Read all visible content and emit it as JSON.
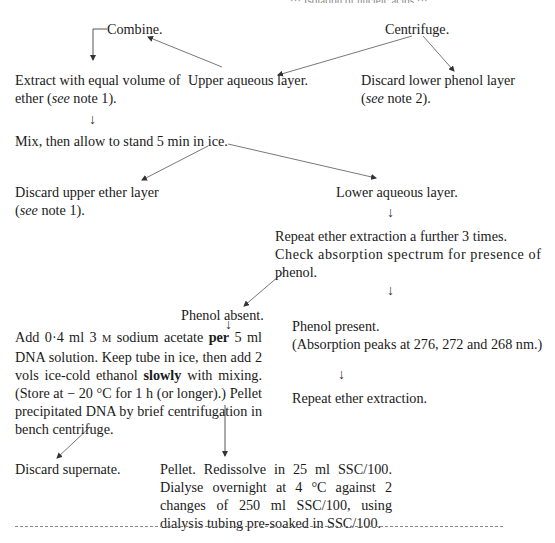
{
  "page": {
    "header_fragment": "··· Isolation of nucleic acids ···",
    "footer_fragment": ""
  },
  "flowchart": {
    "combine": "Combine.",
    "centrifuge": "Centrifuge.",
    "extract": {
      "line1": "Extract with equal volume of",
      "line2_pre": "ether (",
      "line2_see": "see",
      "line2_post": " note 1)."
    },
    "upper_aqueous": "Upper aqueous layer.",
    "discard_phenol": {
      "line1": "Discard lower phenol layer",
      "line2_pre": "(",
      "line2_see": "see",
      "line2_post": " note 2)."
    },
    "mix": "Mix, then allow to stand 5 min in ice.",
    "discard_ether": {
      "line1": "Discard upper ether layer",
      "line2_pre": "(",
      "line2_see": "see",
      "line2_post": " note 1)."
    },
    "lower_aqueous": "Lower aqueous layer.",
    "repeat_check": {
      "line1": "Repeat ether extraction a further 3 times.",
      "line2": "Check absorption spectrum for presence of",
      "line3": "phenol."
    },
    "phenol_absent": "Phenol absent.",
    "phenol_present": {
      "line1": "Phenol present.",
      "line2": "(Absorption peaks at 276, 272 and 268 nm.)"
    },
    "add_acetate": {
      "part1": "Add 0·4 ml 3 ",
      "molar": "M",
      "part2": " sodium acetate ",
      "per": "per",
      "part3": " 5 ml DNA solution. Keep tube in ice, then add 2 vols ice-cold ethanol ",
      "slowly": "slowly",
      "part4": " with mixing. (Store at − 20 °C for 1 h (or longer).) Pellet precipitated DNA by brief centrifugation in bench centrifuge."
    },
    "repeat_ether": "Repeat ether extraction.",
    "discard_supernate": "Discard supernate.",
    "pellet": "Pellet. Redissolve in 25 ml SSC/100. Dialyse overnight at 4 °C against 2 changes of 250 ml SSC/100, using dialysis tubing pre-soaked in SSC/100."
  },
  "icons": {
    "down_arrow": "↓"
  },
  "colors": {
    "text": "#1a1a1a",
    "arrow": "#555555",
    "rule": "#8a8a8a"
  }
}
